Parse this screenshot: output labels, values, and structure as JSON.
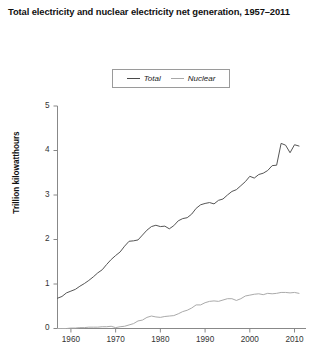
{
  "chart_data": {
    "type": "line",
    "title": "Total electricity and nuclear electricity net generation, 1957–2011",
    "xlabel": "",
    "ylabel": "Trillion kilowatthours",
    "xlim": [
      1957,
      2011
    ],
    "ylim": [
      0,
      5
    ],
    "yticks": [
      0,
      1,
      2,
      3,
      4,
      5
    ],
    "ytick_labels": [
      "0",
      "1",
      "2",
      "3",
      "4",
      "5"
    ],
    "xticks": [
      1960,
      1970,
      1980,
      1990,
      2000,
      2010
    ],
    "xtick_labels": [
      "1960",
      "1970",
      "1980",
      "1990",
      "2000",
      "2010"
    ],
    "grid": false,
    "legend_position": "top-center",
    "legend": [
      "Total",
      "Nuclear"
    ],
    "colors": {
      "total": "#555555",
      "nuclear": "#aaaaaa",
      "axis": "#888888",
      "text": "#222222"
    },
    "x": [
      1957,
      1958,
      1959,
      1960,
      1961,
      1962,
      1963,
      1964,
      1965,
      1966,
      1967,
      1968,
      1969,
      1970,
      1971,
      1972,
      1973,
      1974,
      1975,
      1976,
      1977,
      1978,
      1979,
      1980,
      1981,
      1982,
      1983,
      1984,
      1985,
      1986,
      1987,
      1988,
      1989,
      1990,
      1991,
      1992,
      1993,
      1994,
      1995,
      1996,
      1997,
      1998,
      1999,
      2000,
      2001,
      2002,
      2003,
      2004,
      2005,
      2006,
      2007,
      2008,
      2009,
      2010,
      2011
    ],
    "series": [
      {
        "name": "Total",
        "values": [
          0.68,
          0.72,
          0.8,
          0.84,
          0.88,
          0.95,
          1.01,
          1.08,
          1.16,
          1.25,
          1.32,
          1.44,
          1.55,
          1.64,
          1.72,
          1.85,
          1.96,
          1.97,
          1.99,
          2.1,
          2.21,
          2.29,
          2.32,
          2.29,
          2.3,
          2.24,
          2.31,
          2.42,
          2.47,
          2.49,
          2.57,
          2.7,
          2.78,
          2.81,
          2.83,
          2.8,
          2.88,
          2.91,
          3.0,
          3.08,
          3.12,
          3.21,
          3.3,
          3.42,
          3.38,
          3.46,
          3.49,
          3.55,
          3.66,
          3.67,
          4.16,
          4.12,
          3.95,
          4.13,
          4.1
        ]
      },
      {
        "name": "Nuclear",
        "values": [
          0.0,
          0.0,
          0.0,
          0.01,
          0.01,
          0.02,
          0.02,
          0.03,
          0.03,
          0.03,
          0.04,
          0.04,
          0.05,
          0.02,
          0.04,
          0.05,
          0.08,
          0.11,
          0.17,
          0.19,
          0.25,
          0.28,
          0.26,
          0.25,
          0.27,
          0.28,
          0.29,
          0.33,
          0.38,
          0.41,
          0.46,
          0.53,
          0.53,
          0.58,
          0.61,
          0.62,
          0.61,
          0.64,
          0.67,
          0.67,
          0.63,
          0.67,
          0.73,
          0.75,
          0.77,
          0.78,
          0.76,
          0.79,
          0.78,
          0.79,
          0.81,
          0.81,
          0.8,
          0.81,
          0.79
        ]
      }
    ]
  }
}
